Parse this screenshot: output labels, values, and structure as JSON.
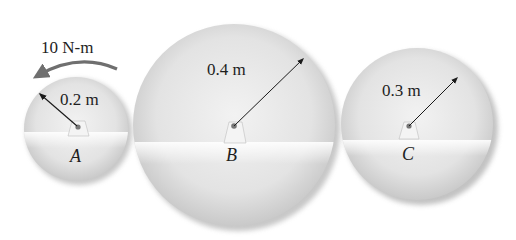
{
  "figure": {
    "moment": {
      "label": "10 N-m",
      "direction": "counterclockwise",
      "color": "#6f6f6f"
    },
    "discs": [
      {
        "id": "A",
        "label": "A",
        "radius_label": "0.2 m"
      },
      {
        "id": "B",
        "label": "B",
        "radius_label": "0.4 m"
      },
      {
        "id": "C",
        "label": "C",
        "radius_label": "0.3 m"
      }
    ]
  }
}
